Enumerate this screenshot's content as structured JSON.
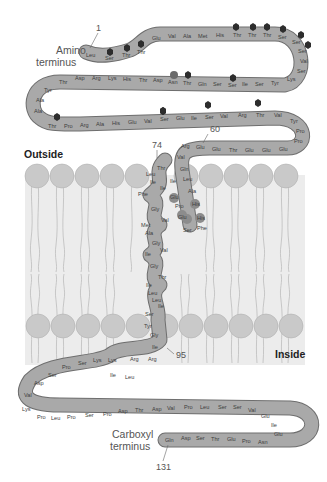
{
  "diagram": {
    "type": "transmembrane-protein-topology",
    "labels": {
      "amino_terminus_line1": "Amino",
      "amino_terminus_line2": "terminus",
      "carboxyl_terminus_line1": "Carboxyl",
      "carboxyl_terminus_line2": "terminus",
      "outside": "Outside",
      "inside": "Inside"
    },
    "position_markers": {
      "p1": "1",
      "p60": "60",
      "p74": "74",
      "p95": "95",
      "p131": "131"
    },
    "colors": {
      "chain_fill": "#a8a8a8",
      "chain_stroke": "#6e6e6e",
      "membrane_head": "#c8c8c8",
      "membrane_tail_stroke": "#b5b5b5",
      "membrane_bg": "#ececec",
      "glycosylation_hexagon": "#2d2d2d",
      "highlight_residue": "#8c8c8c"
    },
    "segments": {
      "seg1": [
        "Leu",
        "Ser",
        "Thr",
        "Thr"
      ],
      "seg2": [
        "Glu",
        "Val",
        "Ala",
        "Met",
        "His",
        "Thr",
        "Thr",
        "Thr",
        "Ser",
        "Ser",
        "Ser",
        "Val",
        "Ser",
        "Lys"
      ],
      "seg3": [
        "Tyr",
        "Ser",
        "Ile",
        "Ser",
        "Ser",
        "Gln",
        "Thr",
        "Asn",
        "Asp",
        "Thr",
        "His",
        "Lys",
        "Arg",
        "Asp",
        "Thr"
      ],
      "seg4": [
        "Tyr",
        "Ala",
        "Ala",
        "Thr",
        "Pro",
        "Arg",
        "Ala",
        "His",
        "Glu",
        "Val",
        "Ser",
        "Glu",
        "Ile",
        "Ser",
        "Val",
        "Arg",
        "Thr",
        "Val",
        "Tyr",
        "Pro",
        "Pro",
        "Glu"
      ],
      "seg5": [
        "Glu",
        "Glu",
        "Thr",
        "Glu",
        "Glu",
        "Arg",
        "Val"
      ],
      "helix_short": [
        "Gln",
        "Leu",
        "Ala",
        "His",
        "His",
        "Phe",
        "Ser",
        "Glu",
        "Pro",
        "Glu",
        "Ile"
      ],
      "helix_tm": [
        "Thr",
        "Leu",
        "Ile",
        "Ile",
        "Phe",
        "Gly",
        "Val",
        "Met",
        "Ala",
        "Gly",
        "Val",
        "Ile",
        "Gly",
        "Thr",
        "Ile",
        "Leu",
        "Leu",
        "Ile",
        "Ser",
        "Tyr",
        "Gly",
        "Ile"
      ],
      "seg_c1": [
        "Arg",
        "Arg",
        "Leu",
        "Ile",
        "Lys",
        "Lys",
        "Ser",
        "Pro",
        "Ser",
        "Asp",
        "Val",
        "Lys"
      ],
      "seg_c2": [
        "Pro",
        "Leu",
        "Pro",
        "Ser",
        "Pro",
        "Asp",
        "Thr",
        "Asp",
        "Val",
        "Pro",
        "Leu",
        "Ser",
        "Ser",
        "Val",
        "Glu",
        "Ile",
        "Glu"
      ],
      "seg_c3": [
        "Asn",
        "Pro",
        "Glu",
        "Thr",
        "Ser",
        "Asp",
        "Gln"
      ]
    }
  }
}
